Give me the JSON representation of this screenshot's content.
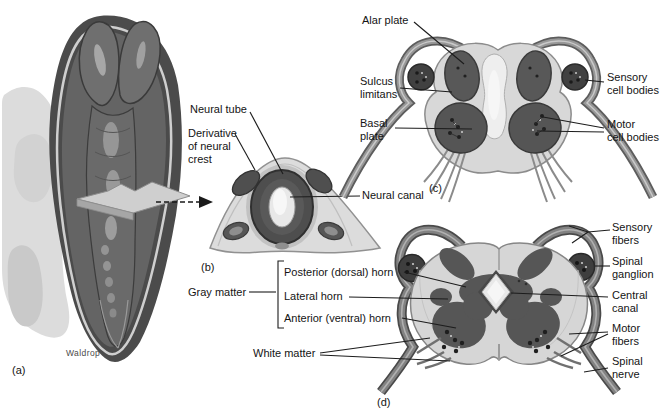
{
  "figure": {
    "palette": {
      "background": "#ffffff",
      "ink": "#1c1c1c",
      "dark_tissue": "#565656",
      "mid_tissue": "#8c8c8c",
      "light_tissue": "#d8d8d8",
      "canal_light": "#efefef",
      "ganglion": "#3e3e3e"
    },
    "panel_a": {
      "tag": "(a)",
      "credit": "Waldrop"
    },
    "panel_b": {
      "tag": "(b)",
      "labels": {
        "neural_tube": "Neural tube",
        "neural_crest": "Derivative\nof neural\ncrest",
        "neural_canal": "Neural canal"
      }
    },
    "panel_c": {
      "tag": "(c)",
      "labels": {
        "alar_plate": "Alar plate",
        "sulcus_limitans": "Sulcus\nlimitans",
        "basal_plate": "Basal\nplate",
        "sensory_cell_bodies": "Sensory\ncell bodies",
        "motor_cell_bodies": "Motor\ncell bodies"
      }
    },
    "panel_d": {
      "tag": "(d)",
      "labels": {
        "gray_matter": "Gray matter",
        "posterior_horn": "Posterior (dorsal) horn",
        "lateral_horn": "Lateral horn",
        "anterior_horn": "Anterior (ventral) horn",
        "white_matter": "White matter",
        "sensory_fibers": "Sensory\nfibers",
        "spinal_ganglion": "Spinal\nganglion",
        "central_canal": "Central\ncanal",
        "motor_fibers": "Motor\nfibers",
        "spinal_nerve": "Spinal\nnerve"
      }
    }
  }
}
